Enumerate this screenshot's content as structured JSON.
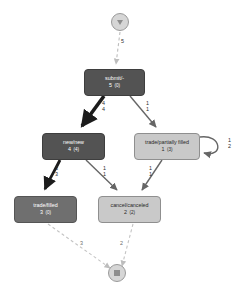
{
  "diagram": {
    "type": "directly-follows-graph",
    "background_color": "#ffffff"
  },
  "endpoints": {
    "start": {
      "name": "start-node",
      "icon": "play-icon",
      "x": 120,
      "y": 22,
      "r": 9
    },
    "end": {
      "name": "end-node",
      "icon": "stop-icon",
      "x": 117,
      "y": 273,
      "r": 9
    }
  },
  "nodes": [
    {
      "id": "submit",
      "label": "submit/-",
      "frequency": "5",
      "frequency_secondary": "(0)",
      "shade": "node-dark",
      "color": "#535353",
      "x": 84,
      "y": 69,
      "w": 61,
      "h": 27
    },
    {
      "id": "new",
      "label": "new/new",
      "frequency": "4",
      "frequency_secondary": "(4)",
      "shade": "node-dark",
      "color": "#535353",
      "x": 42,
      "y": 133,
      "w": 63,
      "h": 27
    },
    {
      "id": "trade-partially-filled",
      "label": "trade/partially filled",
      "frequency": "1",
      "frequency_secondary": "(3)",
      "shade": "node-light",
      "color": "#c9c9c9",
      "x": 134,
      "y": 133,
      "w": 66,
      "h": 27
    },
    {
      "id": "trade-filled",
      "label": "trade/filled",
      "frequency": "3",
      "frequency_secondary": "(0)",
      "shade": "node-mid",
      "color": "#6f6f6f",
      "x": 14,
      "y": 196,
      "w": 63,
      "h": 27
    },
    {
      "id": "cancel-canceled",
      "label": "cancel/canceled",
      "frequency": "2",
      "frequency_secondary": "(2)",
      "shade": "node-light",
      "color": "#c9c9c9",
      "x": 98,
      "y": 196,
      "w": 63,
      "h": 27
    }
  ],
  "edges": [
    {
      "id": "e-start-submit",
      "from": "start",
      "to": "submit",
      "label": "5",
      "label2": "",
      "style": "dashed",
      "color": "#b9b9b9",
      "width": 1,
      "lx": 124,
      "ly": 42
    },
    {
      "id": "e-submit-new",
      "from": "submit",
      "to": "new",
      "label": "4",
      "label2": "4",
      "style": "solid",
      "color": "#1c1c1c",
      "width": 3.4,
      "lx": 104,
      "ly": 103
    },
    {
      "id": "e-submit-trade",
      "from": "submit",
      "to": "trade-partially-filled",
      "label": "1",
      "label2": "1",
      "style": "solid",
      "color": "#666666",
      "width": 1.2,
      "lx": 148,
      "ly": 103
    },
    {
      "id": "e-new-tradefilled",
      "from": "new",
      "to": "trade-filled",
      "label": "3",
      "label2": "3",
      "style": "solid",
      "color": "#1c1c1c",
      "width": 2.6,
      "lx": 57,
      "ly": 168
    },
    {
      "id": "e-new-cancel",
      "from": "new",
      "to": "cancel-canceled",
      "label": "1",
      "label2": "1",
      "style": "solid",
      "color": "#666666",
      "width": 1.2,
      "lx": 104,
      "ly": 168
    },
    {
      "id": "e-trade-cancel",
      "from": "trade-partially-filled",
      "to": "cancel-canceled",
      "label": "1",
      "label2": "1",
      "style": "solid",
      "color": "#666666",
      "width": 1.2,
      "lx": 150,
      "ly": 168
    },
    {
      "id": "e-trade-self",
      "from": "trade-partially-filled",
      "to": "trade-partially-filled",
      "label": "1",
      "label2": "2",
      "style": "solid",
      "color": "#666666",
      "width": 1.2,
      "lx": 226,
      "ly": 140
    },
    {
      "id": "e-tradefilled-end",
      "from": "trade-filled",
      "to": "end",
      "label": "3",
      "label2": "",
      "style": "dashed",
      "color": "#bfbfbf",
      "width": 1,
      "lx": 81,
      "ly": 243
    },
    {
      "id": "e-cancel-end",
      "from": "cancel-canceled",
      "to": "end",
      "label": "2",
      "label2": "",
      "style": "dashed",
      "color": "#bfbfbf",
      "width": 1,
      "lx": 121,
      "ly": 243
    }
  ]
}
